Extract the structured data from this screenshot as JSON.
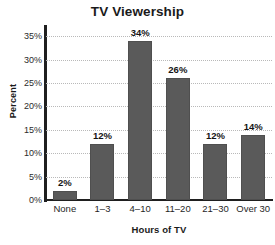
{
  "chart_data": {
    "type": "bar",
    "title": "TV Viewership",
    "xlabel": "Hours of TV",
    "ylabel": "Percent",
    "categories": [
      "None",
      "1–3",
      "4–10",
      "11–20",
      "21–30",
      "Over 30"
    ],
    "values": [
      2,
      12,
      34,
      26,
      12,
      14
    ],
    "value_labels": [
      "2%",
      "12%",
      "34%",
      "26%",
      "12%",
      "14%"
    ],
    "ylim": [
      0,
      37
    ],
    "yticks": [
      0,
      5,
      10,
      15,
      20,
      25,
      30,
      35
    ],
    "ytick_labels": [
      "0%",
      "5%",
      "10%",
      "15%",
      "20%",
      "25%",
      "30%",
      "35%"
    ],
    "grid": true,
    "grid_axis": "y",
    "grid_style": "dotted",
    "legend": false,
    "bar_color": "#5a5a5a",
    "axis_color": "#1f1f1f",
    "grid_color": "#b9b9b9",
    "background": "#ffffff"
  }
}
